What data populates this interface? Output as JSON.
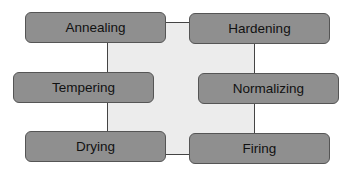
{
  "diagram": {
    "type": "process-grid",
    "nodes": [
      {
        "id": "annealing",
        "label": "Annealing"
      },
      {
        "id": "hardening",
        "label": "Hardening"
      },
      {
        "id": "tempering",
        "label": "Tempering"
      },
      {
        "id": "normalizing",
        "label": "Normalizing"
      },
      {
        "id": "drying",
        "label": "Drying"
      },
      {
        "id": "firing",
        "label": "Firing"
      }
    ],
    "colors": {
      "box_fill": "#8f8f8f",
      "box_border": "#555555",
      "center_fill": "#ececec",
      "line": "#444444"
    }
  }
}
